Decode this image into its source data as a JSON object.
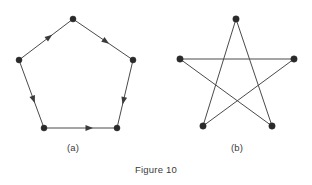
{
  "figure": {
    "caption": "Figure 10",
    "background_color": "#ffffff",
    "line_color": "#4a4a4a",
    "vertex_color": "#2a2a2a",
    "panels": [
      {
        "id": "a",
        "label": "(a)",
        "label_x": 73,
        "label_y": 148,
        "kind": "directed-pentagon-cycle",
        "vertex_radius": 3.0,
        "vertices": [
          {
            "name": "top",
            "x": 73,
            "y": 19
          },
          {
            "name": "right",
            "x": 133,
            "y": 60
          },
          {
            "name": "bottom-right",
            "x": 117,
            "y": 128
          },
          {
            "name": "bottom-left",
            "x": 44,
            "y": 128
          },
          {
            "name": "left",
            "x": 19,
            "y": 60
          }
        ],
        "edges": [
          {
            "from": "left",
            "to": "top",
            "directed": true,
            "arrow_t": 0.56
          },
          {
            "from": "top",
            "to": "right",
            "directed": true,
            "arrow_t": 0.55
          },
          {
            "from": "right",
            "to": "bottom-right",
            "directed": true,
            "arrow_t": 0.6
          },
          {
            "from": "left",
            "to": "bottom-left",
            "directed": true,
            "arrow_t": 0.58
          },
          {
            "from": "bottom-left",
            "to": "bottom-right",
            "directed": true,
            "arrow_t": 0.62
          }
        ]
      },
      {
        "id": "b",
        "label": "(b)",
        "label_x": 237,
        "label_y": 148,
        "kind": "pentagram",
        "vertex_radius": 3.2,
        "vertices": [
          {
            "name": "top",
            "x": 236,
            "y": 19
          },
          {
            "name": "right",
            "x": 294,
            "y": 59
          },
          {
            "name": "bottom-right",
            "x": 272,
            "y": 126
          },
          {
            "name": "bottom-left",
            "x": 203,
            "y": 126
          },
          {
            "name": "left",
            "x": 180,
            "y": 59
          }
        ],
        "edges": [
          {
            "from": "top",
            "to": "bottom-right",
            "directed": false
          },
          {
            "from": "bottom-right",
            "to": "left",
            "directed": false
          },
          {
            "from": "left",
            "to": "right",
            "directed": false
          },
          {
            "from": "right",
            "to": "bottom-left",
            "directed": false
          },
          {
            "from": "bottom-left",
            "to": "top",
            "directed": false
          }
        ]
      }
    ]
  }
}
